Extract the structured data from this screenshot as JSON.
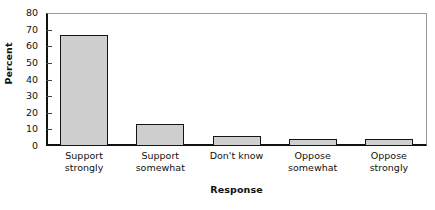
{
  "chart_data": {
    "type": "bar",
    "title": "",
    "categories": [
      "Support strongly",
      "Support somewhat",
      "Don't know",
      "Oppose somewhat",
      "Oppose strongly"
    ],
    "category_lines": [
      [
        "Support",
        "strongly"
      ],
      [
        "Support",
        "somewhat"
      ],
      [
        "Don't know",
        ""
      ],
      [
        "Oppose",
        "somewhat"
      ],
      [
        "Oppose",
        "strongly"
      ]
    ],
    "values": [
      67,
      13,
      6,
      4.5,
      4
    ],
    "xlabel": "Response",
    "ylabel": "Percent",
    "ylim": [
      0,
      80
    ],
    "yticks": [
      0,
      10,
      20,
      30,
      40,
      50,
      60,
      70,
      80
    ],
    "ytick_labels": [
      "0",
      "10",
      "20",
      "30",
      "40",
      "50",
      "60",
      "70",
      "80"
    ],
    "grid": false,
    "legend": false,
    "bar_fill_color": "#cfcfcf",
    "bar_border_color": "#141414",
    "axis_color": "#111111",
    "frame_color": "#9a9a9a",
    "background_color": "#ffffff"
  }
}
